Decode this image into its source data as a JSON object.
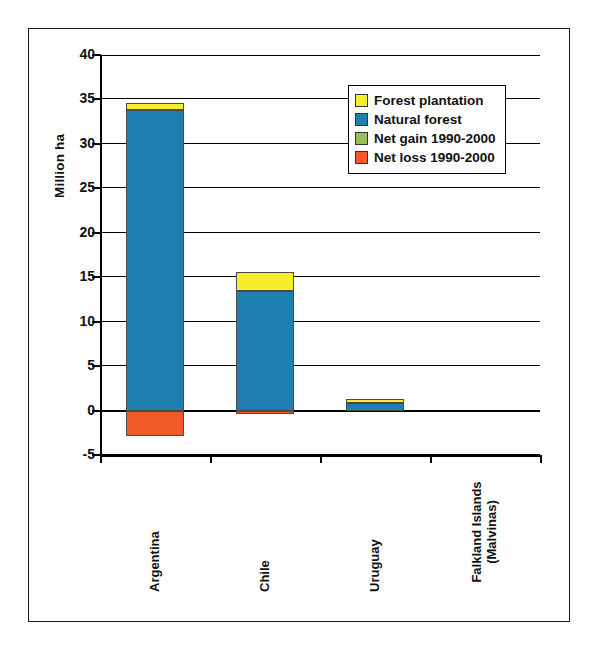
{
  "chart_data": {
    "type": "bar",
    "title": "",
    "subtitle": "",
    "xlabel": "",
    "ylabel": "Million ha",
    "ylim": [
      -5,
      40
    ],
    "ytick_step": 5,
    "yticks": [
      40,
      35,
      30,
      25,
      20,
      15,
      10,
      5,
      0,
      -5
    ],
    "ytick_labels": [
      "40",
      "35",
      "30",
      "25",
      "20",
      "15",
      "10",
      "5",
      "0",
      "-5"
    ],
    "grid": true,
    "grid_axis": "y",
    "stacked": true,
    "legend_position": "upper-right-inside",
    "categories": [
      "Argentina",
      "Chile",
      "Uruguay",
      "Falkland Islands (Malvinas)"
    ],
    "category_label_lines": [
      [
        "Argentina"
      ],
      [
        "Chile"
      ],
      [
        "Uruguay"
      ],
      [
        "Falkland Islands",
        "(Malvinas)"
      ]
    ],
    "series": [
      {
        "name": "Forest plantation",
        "color": "#F5EE2B",
        "values": [
          0.8,
          2.2,
          0.5,
          0.0
        ]
      },
      {
        "name": "Natural forest",
        "color": "#1F7FB0",
        "values": [
          33.8,
          13.4,
          0.8,
          0.0
        ]
      },
      {
        "name": "Net gain 1990-2000",
        "color": "#9BBE5A",
        "values": [
          0.0,
          0.0,
          0.0,
          0.0
        ]
      },
      {
        "name": "Net loss 1990-2000",
        "color": "#F15A29",
        "values": [
          -2.9,
          -0.25,
          0.0,
          0.0
        ]
      }
    ]
  },
  "legend": {
    "items": [
      {
        "label": "Forest plantation",
        "color": "#F5EE2B"
      },
      {
        "label": "Natural forest",
        "color": "#1F7FB0"
      },
      {
        "label": "Net gain 1990-2000",
        "color": "#9BBE5A"
      },
      {
        "label": "Net loss 1990-2000",
        "color": "#F15A29"
      }
    ]
  },
  "axes": {
    "y_title": "Million ha"
  },
  "colors": {
    "plantation": "#F5EE2B",
    "natural_forest": "#1F7FB0",
    "net_gain": "#9BBE5A",
    "net_loss": "#F15A29",
    "axis": "#000000",
    "frame": "#1a1a1a",
    "background": "#ffffff"
  }
}
